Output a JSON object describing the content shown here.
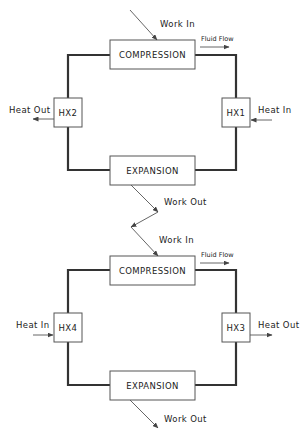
{
  "diagram": {
    "cycles": [
      {
        "id": "upper",
        "components": {
          "compression": {
            "label": "COMPRESSION",
            "x": 110,
            "y": 40,
            "w": 85,
            "h": 29
          },
          "expansion": {
            "label": "EXPANSION",
            "x": 110,
            "y": 156,
            "w": 85,
            "h": 29
          },
          "hx_left": {
            "label": "HX2",
            "x": 54,
            "y": 98,
            "w": 28,
            "h": 29
          },
          "hx_right": {
            "label": "HX1",
            "x": 222,
            "y": 98,
            "w": 28,
            "h": 29
          }
        },
        "labels": {
          "work_in": "Work In",
          "work_out": "Work Out",
          "fluid_flow": "Fluid Flow",
          "left_heat": "Heat Out",
          "right_heat": "Heat In"
        },
        "heat_directions": {
          "HX2": "out",
          "HX1": "in"
        }
      },
      {
        "id": "lower",
        "components": {
          "compression": {
            "label": "COMPRESSION",
            "x": 110,
            "y": 256,
            "w": 85,
            "h": 29
          },
          "expansion": {
            "label": "EXPANSION",
            "x": 110,
            "y": 371,
            "w": 85,
            "h": 29
          },
          "hx_left": {
            "label": "HX4",
            "x": 54,
            "y": 313,
            "w": 28,
            "h": 29
          },
          "hx_right": {
            "label": "HX3",
            "x": 222,
            "y": 313,
            "w": 28,
            "h": 29
          }
        },
        "labels": {
          "work_in": "Work In",
          "work_out": "Work Out",
          "fluid_flow": "Fluid Flow",
          "left_heat": "Heat In",
          "right_heat": "Heat Out"
        },
        "heat_directions": {
          "HX4": "in",
          "HX3": "out"
        }
      }
    ],
    "colors": {
      "loop": "#333333",
      "box_stroke": "#555555",
      "text": "#222222",
      "background": "#ffffff"
    }
  }
}
